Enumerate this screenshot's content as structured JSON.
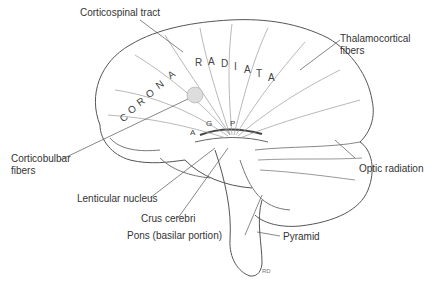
{
  "figure": {
    "region_labels": {
      "corona": [
        "C",
        "O",
        "R",
        "O",
        "N",
        "A"
      ],
      "radiata": [
        "R",
        "A",
        "D",
        "I",
        "A",
        "T",
        "A"
      ]
    },
    "labels": [
      {
        "id": "corticospinal",
        "text": "Corticospinal tract"
      },
      {
        "id": "thalamocortical_1",
        "text": "Thalamocortical"
      },
      {
        "id": "thalamocortical_2",
        "text": "fibers"
      },
      {
        "id": "corticobulbar_1",
        "text": "Corticobulbar"
      },
      {
        "id": "corticobulbar_2",
        "text": "fibers"
      },
      {
        "id": "optic_radiation",
        "text": "Optic radiation"
      },
      {
        "id": "lenticular",
        "text": "Lenticular nucleus"
      },
      {
        "id": "crus",
        "text": "Crus cerebri"
      },
      {
        "id": "pons",
        "text": "Pons (basilar portion)"
      },
      {
        "id": "pyramid",
        "text": "Pyramid"
      }
    ],
    "capsule_letters": [
      "A",
      "G",
      "P"
    ],
    "signature": "RD"
  }
}
